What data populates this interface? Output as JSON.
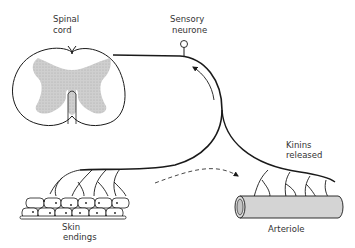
{
  "diagram": {
    "labels": {
      "spinal_cord": [
        "Spinal",
        "cord"
      ],
      "sensory_neurone": [
        "Sensory",
        "neurone"
      ],
      "kinins_released": [
        "Kinins",
        "released"
      ],
      "skin_endings": [
        "Skin",
        "endings"
      ],
      "arteriole": "Arteriole"
    },
    "colors": {
      "line": "#1a1a1a",
      "grey_matter": "#c8c8c8",
      "arteriole_fill": "#d4d4d4",
      "text": "#333333"
    },
    "nodes": [
      {
        "id": "spinal-cord",
        "label": "Spinal cord"
      },
      {
        "id": "sensory-neurone",
        "label": "Sensory neurone"
      },
      {
        "id": "skin-endings",
        "label": "Skin endings"
      },
      {
        "id": "arteriole",
        "label": "Arteriole"
      }
    ],
    "edges": [
      {
        "from": "skin-endings",
        "to": "spinal-cord",
        "style": "solid",
        "meaning": "afferent signal direction"
      },
      {
        "from": "skin-endings",
        "to": "arteriole",
        "style": "dashed",
        "meaning": "axon reflex"
      }
    ]
  }
}
